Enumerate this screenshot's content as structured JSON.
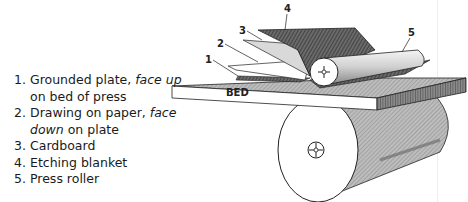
{
  "figure": {
    "bed_label": "BED",
    "callouts": [
      "1",
      "2",
      "3",
      "4",
      "5"
    ]
  },
  "legend": {
    "items": [
      {
        "num": "1.",
        "text": "Grounded plate, ",
        "italic": "face up",
        "text2": "",
        "line2": "on bed of press",
        "line2_italic": ""
      },
      {
        "num": "2.",
        "text": "Drawing on paper, ",
        "italic": "face",
        "text2": "",
        "line2_italic": "down",
        "line2": " on plate"
      },
      {
        "num": "3.",
        "text": "Cardboard"
      },
      {
        "num": "4.",
        "text": "Etching blanket"
      },
      {
        "num": "5.",
        "text": "Press roller"
      }
    ]
  },
  "colors": {
    "ink": "#1a1a1a",
    "shade_dark": "#555555",
    "shade_mid": "#9a9a9a",
    "shade_light": "#cfcfcf",
    "paper": "#ffffff"
  }
}
